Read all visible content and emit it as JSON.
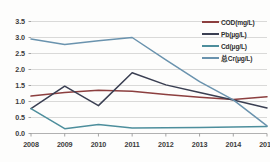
{
  "chart_data": {
    "type": "line",
    "title": "",
    "xlabel": "",
    "ylabel": "",
    "categories": [
      "2008",
      "2009",
      "2010",
      "2011",
      "2012",
      "2013",
      "2014",
      "2015"
    ],
    "x": [
      2008,
      2009,
      2010,
      2011,
      2012,
      2013,
      2014,
      2015
    ],
    "ylim": [
      0.0,
      3.5
    ],
    "xlim": [
      2008,
      2015
    ],
    "yticks": [
      "0.0",
      "0.5",
      "1.0",
      "1.5",
      "2.0",
      "2.5",
      "3.0",
      "3.5"
    ],
    "ytick_values": [
      0.0,
      0.5,
      1.0,
      1.5,
      2.0,
      2.5,
      3.0,
      3.5
    ],
    "grid": "horizontal",
    "legend_position": "top-right",
    "series": [
      {
        "name": "COD(mg/L)",
        "color": "#8c3f3f",
        "values": [
          1.17,
          1.28,
          1.35,
          1.32,
          1.22,
          1.13,
          1.06,
          1.15
        ]
      },
      {
        "name": "Pb(μg/L)",
        "color": "#3a3f52",
        "values": [
          0.78,
          1.48,
          0.87,
          1.9,
          1.52,
          1.28,
          1.05,
          0.8
        ]
      },
      {
        "name": "Cd(μg/L)",
        "color": "#4d8e9c",
        "values": [
          0.78,
          0.15,
          0.28,
          0.17,
          0.18,
          0.19,
          0.2,
          0.22
        ]
      },
      {
        "name": "总Cr(μg/L)",
        "color": "#6a93ae",
        "values": [
          2.95,
          2.78,
          2.9,
          3.0,
          2.3,
          1.62,
          1.05,
          0.24
        ]
      }
    ]
  },
  "legend": {
    "items": [
      {
        "label": "COD(mg/L)"
      },
      {
        "label": "Pb(μg/L)"
      },
      {
        "label": "Cd(μg/L)"
      },
      {
        "label": "总Cr(μg/L)"
      }
    ]
  }
}
